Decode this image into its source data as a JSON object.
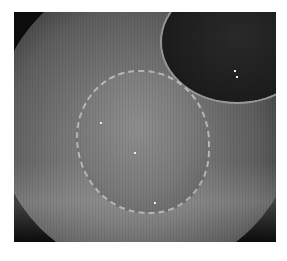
{
  "image": {
    "description": "Grayscale endoscopic view of colonic mucosa with a flat elevated lesion outlined by light reflection spots; dark lumen at upper right",
    "palette": {
      "background": "#ffffff",
      "frame": "#0c0c0c",
      "mucosa": "#767676",
      "lumen": "#1e1e1e",
      "highlight": "#f4f4f4"
    }
  }
}
